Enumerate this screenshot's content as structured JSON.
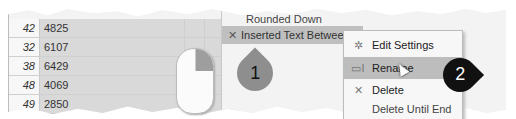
{
  "table": {
    "rows": [
      {
        "index": "42",
        "value": "4825"
      },
      {
        "index": "32",
        "value": "6107"
      },
      {
        "index": "38",
        "value": "6429"
      },
      {
        "index": "48",
        "value": "4069"
      },
      {
        "index": "49",
        "value": "2850"
      }
    ]
  },
  "applied_steps": {
    "previous_step": "Rounded Down",
    "selected_step": "Inserted Text Between Delimiters",
    "selected_step_icon": "close-icon"
  },
  "context_menu": {
    "items": [
      {
        "label": "Edit Settings",
        "icon": "gear-icon"
      },
      {
        "label": "Rename",
        "icon": "rename-icon",
        "highlighted": true
      },
      {
        "label": "Delete",
        "icon": "close-icon"
      },
      {
        "label": "Delete Until End",
        "icon": ""
      }
    ]
  },
  "callouts": [
    {
      "number": "1",
      "color": "#8e8e8e"
    },
    {
      "number": "2",
      "color": "#111111"
    }
  ],
  "mouse": {
    "highlighted_button": "right"
  }
}
